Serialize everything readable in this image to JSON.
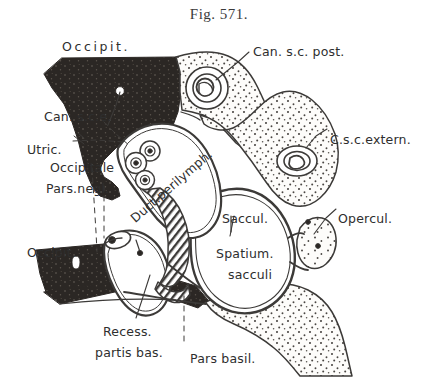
{
  "figure": {
    "title": "Fig. 571.",
    "caption_number": "571",
    "kind": "anatomical-cross-section",
    "style": "engraved line drawing with stipple and solid black shading"
  },
  "colors": {
    "background": "#ffffff",
    "ink": "#2e2e2e",
    "line": "#3c3a38",
    "bone_solid": "#2b2724",
    "stipple": "#4a4643",
    "paper_tint": "#fbfaf8"
  },
  "labels": [
    {
      "id": "occipit-top",
      "text": "Occipit.",
      "x": 62,
      "y": 40,
      "style": "wide"
    },
    {
      "id": "can-sc-post",
      "text": "Can. s.c. post.",
      "x": 253,
      "y": 45,
      "style": ""
    },
    {
      "id": "can-sc-e",
      "text": "Can. s.c.e.",
      "x": 44,
      "y": 110,
      "style": ""
    },
    {
      "id": "utric",
      "text": "Utric.",
      "x": 27,
      "y": 143,
      "style": ""
    },
    {
      "id": "occipitale",
      "text": "Occipitale",
      "x": 50,
      "y": 161,
      "style": ""
    },
    {
      "id": "pars-negl",
      "text": "Pars.negl.",
      "x": 46,
      "y": 182,
      "style": ""
    },
    {
      "id": "csc-extern",
      "text": "C.s.c.extern.",
      "x": 330,
      "y": 133,
      "style": ""
    },
    {
      "id": "duct-perilymph",
      "text": "Duct.perilymph.",
      "x": 128,
      "y": 215,
      "style": "rotated"
    },
    {
      "id": "saccul",
      "text": "Saccul.",
      "x": 222,
      "y": 212,
      "style": ""
    },
    {
      "id": "opercul",
      "text": "Opercul.",
      "x": 338,
      "y": 212,
      "style": ""
    },
    {
      "id": "spatium",
      "text": "Spatium.",
      "x": 216,
      "y": 247,
      "style": ""
    },
    {
      "id": "sacculi",
      "text": "sacculi",
      "x": 228,
      "y": 268,
      "style": ""
    },
    {
      "id": "occipit-left",
      "text": "Occipit.",
      "x": 27,
      "y": 246,
      "style": ""
    },
    {
      "id": "recess",
      "text": "Recess.",
      "x": 103,
      "y": 325,
      "style": ""
    },
    {
      "id": "partis-bas",
      "text": "partis bas.",
      "x": 95,
      "y": 346,
      "style": ""
    },
    {
      "id": "pars-basil",
      "text": "Pars basil.",
      "x": 190,
      "y": 352,
      "style": ""
    }
  ],
  "structures": [
    {
      "id": "occipital-bone-upper",
      "name": "Occipital bone (upper mass)",
      "fill": "solid-black"
    },
    {
      "id": "occipital-bone-lower",
      "name": "Occipital bone (lower bar)",
      "fill": "solid-black"
    },
    {
      "id": "petrous-stipple-upper",
      "name": "Stippled bone, posterior canal region",
      "fill": "stipple"
    },
    {
      "id": "petrous-stipple-mid",
      "name": "Stippled bone, external canal region",
      "fill": "stipple"
    },
    {
      "id": "opercular-stipple",
      "name": "Operculum stipple",
      "fill": "stipple"
    },
    {
      "id": "basilar-stipple",
      "name": "Pars basilaris stipple",
      "fill": "stipple"
    },
    {
      "id": "canal-post-section",
      "name": "Canalis semicircularis posterior, cross-section",
      "fill": "outline"
    },
    {
      "id": "canal-extern-section",
      "name": "Canalis semicircularis externus, cross-section",
      "fill": "outline"
    },
    {
      "id": "utriculus-triad",
      "name": "Utriculus ampullae, three small sections",
      "fill": "outline"
    },
    {
      "id": "perilymph-duct",
      "name": "Ductus perilymphaticus, hatched band",
      "fill": "hatched"
    },
    {
      "id": "sacculus-space",
      "name": "Spatium sacculi cavity",
      "fill": "white"
    },
    {
      "id": "recessus-basilaris",
      "name": "Recessus partis basilaris",
      "fill": "white"
    }
  ],
  "leaders": [
    {
      "from": "can-sc-post",
      "to": "canal-post-section",
      "kind": "solid"
    },
    {
      "from": "csc-extern",
      "to": "canal-extern-section",
      "kind": "solid"
    },
    {
      "from": "opercul",
      "to": "opercular-stipple",
      "kind": "solid"
    },
    {
      "from": "can-sc-e",
      "to": "utriculus-triad",
      "kind": "dashed"
    },
    {
      "from": "utric",
      "to": "utriculus-triad",
      "kind": "dashed"
    },
    {
      "from": "occipitale",
      "to": "occipital-bone-lower",
      "kind": "dashed"
    },
    {
      "from": "pars-negl",
      "to": "occipital-bone-lower",
      "kind": "dashed"
    },
    {
      "from": "recess",
      "to": "recessus-basilaris",
      "kind": "solid"
    },
    {
      "from": "pars-basil",
      "to": "basilar-stipple",
      "kind": "dashed"
    },
    {
      "from": "occipit-top",
      "to": "occipital-bone-upper",
      "kind": "solid"
    },
    {
      "from": "occipit-left",
      "to": "occipital-bone-lower",
      "kind": "solid"
    },
    {
      "from": "saccul",
      "to": "sacculus-space",
      "kind": "solid"
    }
  ]
}
